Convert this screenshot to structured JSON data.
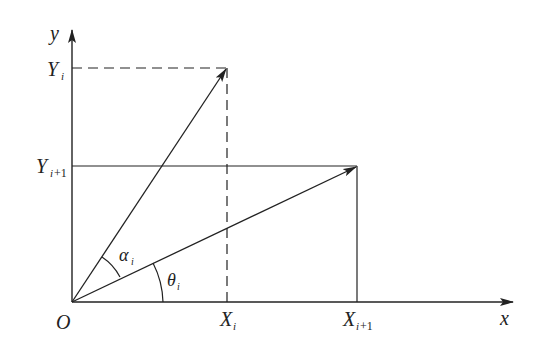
{
  "diagram": {
    "type": "vector-rotation-diagram",
    "axes": {
      "x_label": "x",
      "y_label": "y",
      "origin_label": "O"
    },
    "ticks": {
      "x_i": {
        "base": "X",
        "sub": "i"
      },
      "x_i1": {
        "base": "X",
        "sub": "i",
        "sub_suffix": "+1"
      },
      "y_i": {
        "base": "Y",
        "sub": "i"
      },
      "y_i1": {
        "base": "Y",
        "sub": "i",
        "sub_suffix": "+1"
      }
    },
    "angles": {
      "alpha": {
        "symbol": "α",
        "sub": "i"
      },
      "theta": {
        "symbol": "θ",
        "sub": "i"
      }
    },
    "colors": {
      "line": "#222222",
      "background": "#ffffff"
    }
  }
}
